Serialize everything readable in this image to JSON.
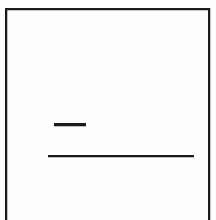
{
  "figure": {
    "width": 216,
    "height": 220,
    "background_color": "#fdfdfd",
    "ink_color": "#1b1b1b"
  },
  "frame": {
    "name": "open-rectangle-border",
    "top_edge": {
      "x": 5,
      "y": 8,
      "length": 205,
      "thickness": 2
    },
    "left_edge": {
      "x": 5,
      "y": 8,
      "length": 212,
      "thickness": 2
    },
    "right_edge": {
      "x": 208,
      "y": 8,
      "length": 212,
      "thickness": 2
    },
    "bottom_edge": "none-cropped-by-image-edge"
  },
  "rules": [
    {
      "name": "short-rule",
      "x": 54,
      "y": 123,
      "width": 32,
      "thickness": 3
    },
    {
      "name": "long-rule",
      "x": 48,
      "y": 155,
      "width": 146,
      "thickness": 2
    }
  ],
  "text_content": []
}
